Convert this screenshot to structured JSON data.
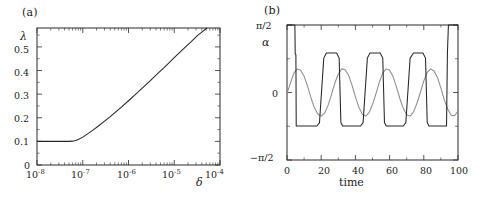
{
  "figure": {
    "background": "#ffffff",
    "panels": [
      "a",
      "b"
    ]
  },
  "panel_a": {
    "label": "(a)",
    "ylabel": "λ",
    "xlabel": "δ",
    "xticks": [
      "10",
      "10",
      "10",
      "10",
      "10"
    ],
    "xtick_exponents": [
      "-8",
      "-7",
      "-6",
      "-5",
      "-4"
    ],
    "yticks": [
      "0",
      "0.1",
      "0.2",
      "0.3",
      "0.4",
      "0.5"
    ]
  },
  "panel_b": {
    "label": "(b)",
    "ylabel": "α",
    "xlabel": "time",
    "yticks": [
      "−π/2",
      "0",
      "π/2"
    ],
    "xticks": [
      "0",
      "20",
      "40",
      "60",
      "80",
      "100"
    ]
  },
  "chart_data": [
    {
      "type": "line",
      "panel": "a",
      "title": "(a)",
      "xlabel": "δ",
      "ylabel": "λ",
      "xscale": "log",
      "xlim": [
        1e-08,
        0.0001
      ],
      "ylim": [
        0,
        0.58
      ],
      "yticks": [
        0,
        0.1,
        0.2,
        0.3,
        0.4,
        0.5
      ],
      "xticks": [
        1e-08,
        1e-07,
        1e-06,
        1e-05,
        0.0001
      ],
      "grid": false,
      "legend": "none",
      "series": [
        {
          "name": "lambda-vs-delta",
          "color": "#262626",
          "x": [
            1e-08,
            1.5e-08,
            2e-08,
            3e-08,
            4e-08,
            5e-08,
            6e-08,
            7e-08,
            8e-08,
            1e-07,
            1.3e-07,
            1.7e-07,
            2.2e-07,
            3e-07,
            4e-07,
            5.5e-07,
            7e-07,
            1e-06,
            1.5e-06,
            2e-06,
            3e-06,
            4.5e-06,
            6e-06,
            1e-05,
            1.5e-05,
            2.2e-05,
            3.2e-05,
            4.2e-05,
            5.2e-05
          ],
          "y": [
            0.1,
            0.1,
            0.1,
            0.1,
            0.1,
            0.1,
            0.101,
            0.104,
            0.108,
            0.118,
            0.133,
            0.149,
            0.165,
            0.186,
            0.205,
            0.228,
            0.245,
            0.272,
            0.303,
            0.325,
            0.357,
            0.39,
            0.412,
            0.455,
            0.487,
            0.517,
            0.548,
            0.566,
            0.58
          ]
        }
      ]
    },
    {
      "type": "line",
      "panel": "b",
      "title": "(b)",
      "xlabel": "time",
      "ylabel": "α",
      "xlim": [
        0,
        100
      ],
      "ylim": [
        -1.5708,
        1.5708
      ],
      "yticks": [
        -1.5708,
        0,
        1.5708
      ],
      "ytick_labels": [
        "−π/2",
        "0",
        "π/2"
      ],
      "xticks": [
        0,
        20,
        40,
        60,
        80,
        100
      ],
      "grid": false,
      "legend": "none",
      "series": [
        {
          "name": "square-wave-alpha",
          "color": "#262626",
          "description": "relaxation-oscillator-like signal switching between plateaus near +0.92 and -0.78 rad, saturating at pi/2 at the start and end",
          "x": [
            0,
            4.6,
            4.8,
            5.2,
            5.4,
            17.5,
            19.0,
            21.5,
            23.0,
            29.0,
            30.5,
            31.5,
            32.5,
            43.0,
            44.5,
            47.0,
            48.5,
            54.5,
            56.0,
            57.0,
            58.0,
            68.0,
            69.5,
            72.0,
            74.0,
            79.5,
            81.0,
            82.0,
            83.0,
            93.3,
            93.8,
            94.4,
            95.0,
            100
          ],
          "y": [
            1.5708,
            1.5708,
            0.9,
            0.88,
            -0.78,
            -0.78,
            -0.7,
            0.8,
            0.92,
            0.92,
            0.8,
            -0.7,
            -0.78,
            -0.78,
            -0.7,
            0.8,
            0.92,
            0.92,
            0.8,
            -0.7,
            -0.78,
            -0.78,
            -0.7,
            0.8,
            0.92,
            0.92,
            0.8,
            -0.7,
            -0.78,
            -0.78,
            0.9,
            1.5708,
            1.5708,
            1.5708
          ]
        },
        {
          "name": "smooth-oscillation-alpha",
          "color": "#8c8c8c",
          "description": "smooth quasi-sinusoidal oscillation of amplitude about 0.55 rad with period near 23 time units",
          "x": [
            0,
            2,
            4,
            6,
            8,
            10,
            12,
            14,
            16,
            18,
            20,
            22,
            24,
            26,
            28,
            30,
            32,
            34,
            36,
            38,
            40,
            42,
            44,
            46,
            48,
            50,
            52,
            54,
            56,
            58,
            60,
            62,
            64,
            66,
            68,
            70,
            72,
            74,
            76,
            78,
            80,
            82,
            84,
            86,
            88,
            90,
            92,
            94,
            96,
            98,
            100
          ],
          "y": [
            -0.02,
            0.22,
            0.45,
            0.55,
            0.52,
            0.38,
            0.15,
            -0.12,
            -0.35,
            -0.5,
            -0.55,
            -0.48,
            -0.3,
            -0.05,
            0.22,
            0.43,
            0.55,
            0.53,
            0.4,
            0.17,
            -0.1,
            -0.34,
            -0.5,
            -0.55,
            -0.47,
            -0.28,
            -0.03,
            0.24,
            0.45,
            0.55,
            0.52,
            0.37,
            0.13,
            -0.14,
            -0.37,
            -0.52,
            -0.55,
            -0.45,
            -0.25,
            0.0,
            0.27,
            0.47,
            0.55,
            0.5,
            0.35,
            0.1,
            -0.17,
            -0.39,
            -0.53,
            -0.54,
            -0.43
          ]
        }
      ]
    }
  ]
}
